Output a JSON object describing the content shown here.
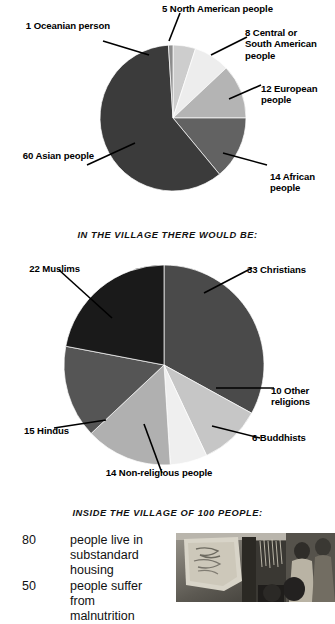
{
  "page": {
    "background": "#ffffff",
    "headings": [
      {
        "id": "village-there-would-be",
        "text": "IN THE VILLAGE THERE WOULD BE:"
      },
      {
        "id": "inside-village-of-100",
        "text": "INSIDE THE VILLAGE OF 100 PEOPLE:"
      }
    ]
  },
  "chart_data": [
    {
      "type": "pie",
      "id": "world-population-by-region",
      "title": "",
      "total": 100,
      "start_angle_deg": -90,
      "direction": "clockwise",
      "categories": [
        "North American people",
        "Central or South American people",
        "European people",
        "African people",
        "Asian people",
        "Oceanian person"
      ],
      "values": [
        5,
        8,
        12,
        14,
        60,
        1
      ],
      "colors": [
        "#cdcdcd",
        "#ededed",
        "#b4b4b4",
        "#626262",
        "#3b3b3b",
        "#8d8d8d"
      ],
      "labels": [
        {
          "text": "5 North American people",
          "value": 5
        },
        {
          "text": "8 Central or\nSouth American\npeople",
          "value": 8
        },
        {
          "text": "12 European\npeople",
          "value": 12
        },
        {
          "text": "14 African\npeople",
          "value": 14
        },
        {
          "text": "60 Asian people",
          "value": 60
        },
        {
          "text": "1 Oceanian person",
          "value": 1
        }
      ]
    },
    {
      "type": "pie",
      "id": "village-by-religion",
      "title": "IN THE VILLAGE THERE WOULD BE:",
      "total": 100,
      "start_angle_deg": -90,
      "direction": "clockwise",
      "categories": [
        "Christians",
        "Other religions",
        "Buddhists",
        "Non-religious people",
        "Hindus",
        "Muslims"
      ],
      "values": [
        33,
        10,
        6,
        14,
        15,
        22
      ],
      "colors": [
        "#4a4a4a",
        "#c6c6c6",
        "#efefef",
        "#b0b0b0",
        "#555555",
        "#1a1a1a"
      ],
      "labels": [
        {
          "text": "33 Christians",
          "value": 33
        },
        {
          "text": "10 Other\nreligions",
          "value": 10
        },
        {
          "text": "6 Buddhists",
          "value": 6
        },
        {
          "text": "14  Non-religious people",
          "value": 14
        },
        {
          "text": "15 Hindus",
          "value": 15
        },
        {
          "text": "22 Muslims",
          "value": 22
        }
      ]
    }
  ],
  "facts": {
    "heading": "INSIDE THE VILLAGE OF 100 PEOPLE:",
    "items": [
      {
        "number": "80",
        "text": "people live in\nsubstandard housing"
      },
      {
        "number": "50",
        "text": "people suffer from\nmalnutrition"
      }
    ]
  },
  "photo": {
    "caption": "",
    "alt_name": "village-photograph"
  }
}
